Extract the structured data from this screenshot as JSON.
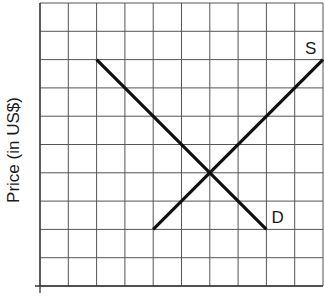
{
  "chart_data": {
    "type": "line",
    "title": "",
    "xlabel": "",
    "ylabel": "Price (in US$)",
    "xlim": [
      0,
      10
    ],
    "ylim": [
      0,
      10
    ],
    "grid": true,
    "grid_divisions": {
      "x": 10,
      "y": 10
    },
    "series": [
      {
        "name": "D",
        "label": "D",
        "points": [
          [
            2,
            8
          ],
          [
            8,
            2
          ]
        ]
      },
      {
        "name": "S",
        "label": "S",
        "points": [
          [
            4,
            2
          ],
          [
            10,
            8
          ]
        ]
      }
    ],
    "equilibrium": [
      6,
      5
    ],
    "colors": {
      "grid": "#555555",
      "curves": "#111111",
      "background": "#ffffff"
    }
  }
}
